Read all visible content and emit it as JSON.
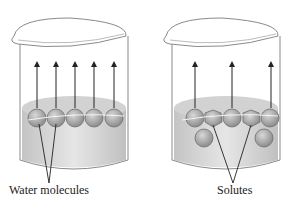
{
  "diagram": {
    "left_beaker": {
      "label": "Water molecules",
      "arrows": 5,
      "surface_particles": [
        "water",
        "water",
        "water",
        "water",
        "water"
      ]
    },
    "right_beaker": {
      "label": "Solutes",
      "arrows": 3,
      "surface_particles": [
        "water",
        "solute",
        "water",
        "solute",
        "water"
      ],
      "submerged_particles": 2
    },
    "colors": {
      "outline": "#8a8a8a",
      "liquid": "#d4d4d4",
      "particle": "#a8a8a8",
      "arrow": "#222222",
      "text": "#222222"
    }
  }
}
